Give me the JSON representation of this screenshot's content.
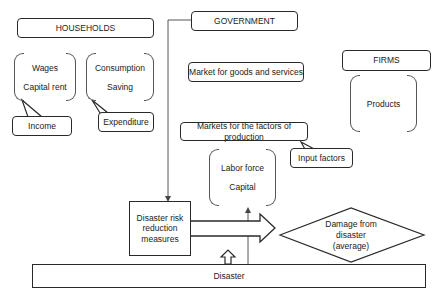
{
  "households": {
    "title": "HOUSEHOLDS",
    "income_group": [
      "Wages",
      "Capital rent"
    ],
    "income_label": "Income",
    "expenditure_group": [
      "Consumption",
      "Saving"
    ],
    "expenditure_label": "Expenditure"
  },
  "government": {
    "title": "GOVERNMENT"
  },
  "markets": {
    "goods": "Market for goods and services",
    "factors": "Markets for the factors of production",
    "factor_group": [
      "Labor force",
      "Capital"
    ],
    "input_label": "Input factors"
  },
  "firms": {
    "title": "FIRMS",
    "group": [
      "Products"
    ]
  },
  "disaster": {
    "drr_lines": [
      "Disaster risk",
      "reduction",
      "measures"
    ],
    "damage_lines": [
      "Damage from",
      "disaster",
      "(average)"
    ],
    "disaster_label": "Disaster"
  }
}
